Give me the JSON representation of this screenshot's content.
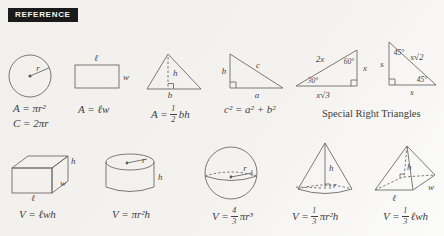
{
  "badge": "REFERENCE",
  "labels": {
    "circle_radius": "r",
    "rectangle_length": "ℓ",
    "rectangle_width": "w",
    "triangle_height": "h",
    "triangle_base": "b",
    "right_triangle_leg_b": "b",
    "right_triangle_hypotenuse": "c",
    "right_triangle_leg_a": "a",
    "tri30_hypotenuse": "2x",
    "tri30_angle60": "60°",
    "tri30_angle30": "30°",
    "tri30_side_x": "x",
    "tri30_base": "x√3",
    "tri45_angle_top": "45°",
    "tri45_side_left": "s",
    "tri45_hypotenuse": "s√2",
    "tri45_angle_right": "45°",
    "tri45_base": "s",
    "box_height": "h",
    "box_width": "w",
    "box_length": "ℓ",
    "cylinder_radius": "r",
    "cylinder_height": "h",
    "sphere_radius": "r",
    "cone_height": "h",
    "cone_radius": "r",
    "pyramid_height": "h",
    "pyramid_length": "ℓ",
    "pyramid_width": "w"
  },
  "formulas": {
    "circle_area": "A = πr²",
    "circle_circumference": "C = 2πr",
    "rectangle_area": "A = ℓw",
    "triangle_area": {
      "pre": "A = ",
      "num": "1",
      "den": "2",
      "post": "bh"
    },
    "pythagorean": "c² = a² + b²",
    "special_right_triangles_caption": "Special Right Triangles",
    "box_volume": "V = ℓwh",
    "cylinder_volume": "V = πr²h",
    "sphere_volume": {
      "pre": "V = ",
      "num": "4",
      "den": "3",
      "post": "πr³"
    },
    "cone_volume": {
      "pre": "V = ",
      "num": "1",
      "den": "3",
      "post": "πr²h"
    },
    "pyramid_volume": {
      "pre": "V = ",
      "num": "1",
      "den": "3",
      "post": "ℓwh"
    }
  }
}
